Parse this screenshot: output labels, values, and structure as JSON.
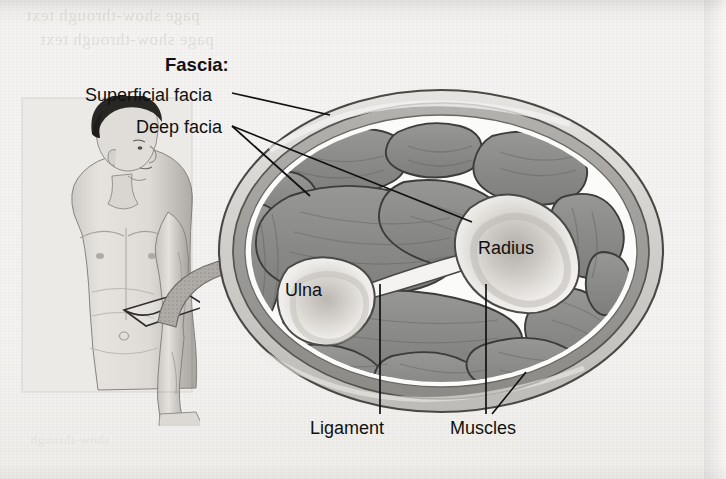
{
  "figure": {
    "background_color": "#f2f1ef",
    "ink_color": "#111111"
  },
  "labels": {
    "fascia_heading": "Fascia:",
    "superficial_fascia": "Superficial facia",
    "deep_fascia": "Deep facia",
    "radius": "Radius",
    "ulna": "Ulna",
    "ligament": "Ligament",
    "muscles": "Muscles"
  },
  "bleed_through": {
    "line1": "page show-through text",
    "line2": "page show-through text",
    "line3": "show-through"
  },
  "colors": {
    "muscle_fill": "#8d8d8d",
    "muscle_outline": "#3f3f3f",
    "bone_fill": "#eceae6",
    "bone_core": "#b9b6b1",
    "fascia_superficial": "#d8d6d2",
    "fascia_deep": "#a2a09c",
    "connective_white": "#fbfbfa",
    "arrow_fill": "#a8a6a3",
    "skin_light": "#e3e0dc",
    "skin_shadow": "#9a9793",
    "hair_dark": "#2b2a28"
  },
  "body_figure": {
    "description": "male torso in anterior view, head turned to the right, left arm hanging with a sectioning plane marked on the forearm",
    "section_plane": "rectangular cut plane drawn around the forearm",
    "arrow": "curved arrow pointing from the forearm section plane to the enlarged cross section"
  },
  "cross_section": {
    "shape": "oval transverse section of the forearm",
    "bones": [
      "Ulna",
      "Radius"
    ],
    "structures": [
      "Superficial facia",
      "Deep facia",
      "Ligament",
      "Muscles"
    ],
    "muscle_compartment_count": 14
  }
}
